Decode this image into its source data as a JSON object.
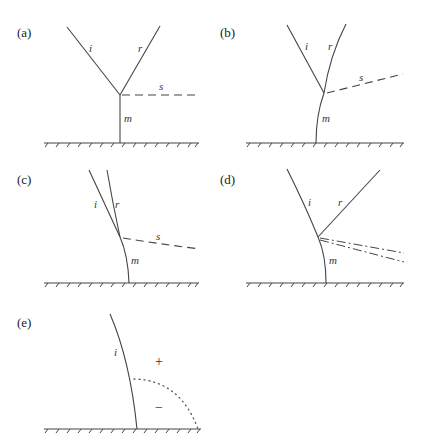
{
  "figure": {
    "panels": [
      {
        "id": "a",
        "label": "(a)",
        "lines": {
          "incident": "i",
          "reflected": "r",
          "stem": "m",
          "shock": "s"
        },
        "description": "Regular Mach reflection: straight i and r meet at triple point; straight vertical Mach stem m; horizontal dashed slip line s"
      },
      {
        "id": "b",
        "label": "(b)",
        "lines": {
          "incident": "i",
          "reflected": "r",
          "stem": "m",
          "shock": "s"
        },
        "description": "Curved reflected shock r and curved stem m; dashed slip line s angled upward"
      },
      {
        "id": "c",
        "label": "(c)",
        "lines": {
          "incident": "i",
          "reflected": "r",
          "stem": "m",
          "shock": "s"
        },
        "description": "Reflected shock r nearly parallel to i; dashed slip line s angled downward"
      },
      {
        "id": "d",
        "label": "(d)",
        "lines": {
          "incident": "i",
          "reflected": "r",
          "stem": "m"
        },
        "description": "Curved incident i; straight reflected r; two dash-dot lines diverging from triple point"
      },
      {
        "id": "e",
        "label": "(e)",
        "lines": {
          "incident": "i"
        },
        "signs": {
          "upper": "+",
          "lower": "−"
        },
        "description": "Curved incident shock i reaching wall; dotted quarter-arc separating + and − regions"
      }
    ]
  }
}
